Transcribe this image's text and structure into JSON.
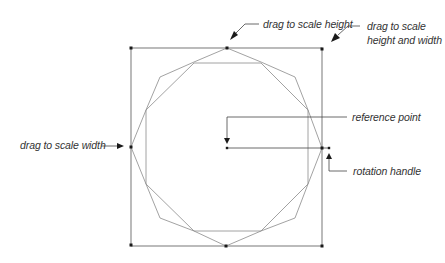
{
  "diagram": {
    "colors": {
      "box": "#555555",
      "shape": "#8a8a8a",
      "handle": "#1a1a1a",
      "leader": "#444444",
      "text": "#333333"
    },
    "labels": {
      "scale_height": "drag to scale height",
      "scale_both_line1": "drag to scale",
      "scale_both_line2": "height and width",
      "reference_point": "reference point",
      "scale_width": "drag to scale width",
      "rotation_handle": "rotation handle"
    },
    "bounding_box": {
      "left": 131,
      "top": 48,
      "right": 322,
      "bottom": 246
    },
    "handles": [
      {
        "name": "top-left",
        "x": 131,
        "y": 48
      },
      {
        "name": "top-middle",
        "x": 227,
        "y": 48
      },
      {
        "name": "top-right",
        "x": 322,
        "y": 49
      },
      {
        "name": "middle-left",
        "x": 131,
        "y": 147
      },
      {
        "name": "middle-right",
        "x": 322,
        "y": 148
      },
      {
        "name": "bottom-left",
        "x": 131,
        "y": 245
      },
      {
        "name": "bottom-middle",
        "x": 226,
        "y": 246
      },
      {
        "name": "bottom-right",
        "x": 322,
        "y": 246
      }
    ],
    "reference_point": {
      "x": 227,
      "y": 148
    },
    "rotation_handle": {
      "x": 329,
      "y": 148
    }
  }
}
